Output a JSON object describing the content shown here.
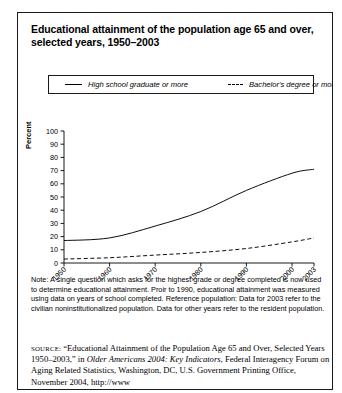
{
  "figure": {
    "title": "Educational attainment of the population age 65 and over, selected years, 1950–2003",
    "ylabel": "Percent"
  },
  "legend": {
    "items": [
      {
        "label": "High school graduate or more",
        "style": "solid"
      },
      {
        "label": "Bachelor's degree or more",
        "style": "dashed"
      }
    ]
  },
  "note": {
    "text": "Note: A single question which asks for the highest grade or degree completed is now used to determine educational attainment. Proir to 1990, educational attainment was measured using data on years of school completed. Reference population: Data for 2003 refer to the civilian noninstitutionalized population. Data for other years refer to the resident population."
  },
  "source": {
    "label": "SOURCE:",
    "part1": "“Educational Attainment of the Population Age 65 and Over, Selected Years 1950–2003,” in ",
    "italic": "Older Americans 2004: Key Indicators",
    "part2": ", Federal Interagency Forum on Aging Related Statistics, Washington, DC, U.S. Government Printing Office, November 2004, http://www"
  },
  "chart_data": {
    "type": "line",
    "title": "Educational attainment of the population age 65 and over, selected years, 1950–2003",
    "xlabel": "",
    "ylabel": "Percent",
    "xlim": [
      1950,
      2003
    ],
    "ylim": [
      0,
      100
    ],
    "grid": false,
    "legend_position": "top",
    "xticks": [
      "1950",
      "1960",
      "1970",
      "1980",
      "1990",
      "2000",
      "2003"
    ],
    "yticks": [
      "0",
      "10",
      "20",
      "30",
      "40",
      "50",
      "60",
      "70",
      "80",
      "90",
      "100"
    ],
    "x": [
      1950,
      1960,
      1970,
      1980,
      1990,
      2000,
      2003
    ],
    "series": [
      {
        "name": "High school graduate or more",
        "style": "solid",
        "values": [
          17,
          19,
          28,
          39,
          55,
          68,
          71
        ]
      },
      {
        "name": "Bachelor's degree or more",
        "style": "dashed",
        "values": [
          3,
          4,
          6,
          8,
          11,
          16,
          19
        ]
      }
    ]
  }
}
